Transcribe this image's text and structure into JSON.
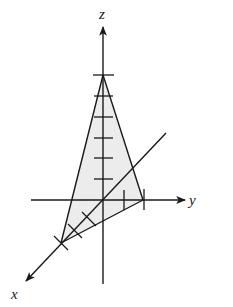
{
  "diagram": {
    "type": "3d-axes-tetrahedron",
    "axes": {
      "x": {
        "label": "x"
      },
      "y": {
        "label": "y"
      },
      "z": {
        "label": "z"
      }
    },
    "ticks": {
      "z_count": 6,
      "y_count": 2,
      "x_count": 3
    },
    "colors": {
      "line": "#1a1a1a",
      "shade": "#ececec",
      "background": "#ffffff"
    }
  }
}
